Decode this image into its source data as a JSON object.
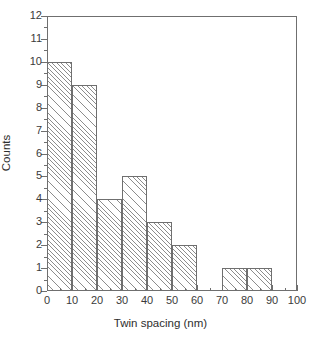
{
  "chart_data": {
    "type": "bar",
    "title": "",
    "subtitle": "",
    "xlabel": "Twin spacing (nm)",
    "ylabel": "Counts",
    "xlim": [
      0,
      100
    ],
    "ylim": [
      0,
      12
    ],
    "grid": false,
    "legend": null,
    "bin_width": 10,
    "bin_edges": [
      0,
      10,
      20,
      30,
      40,
      50,
      60,
      70,
      80,
      90,
      100
    ],
    "categories": [
      "0-10",
      "10-20",
      "20-30",
      "30-40",
      "40-50",
      "50-60",
      "60-70",
      "70-80",
      "80-90",
      "90-100"
    ],
    "values": [
      10,
      9,
      4,
      5,
      3,
      2,
      0,
      1,
      1,
      0
    ],
    "bars": [
      {
        "x0": 0,
        "x1": 10,
        "value": 10
      },
      {
        "x0": 10,
        "x1": 20,
        "value": 9
      },
      {
        "x0": 20,
        "x1": 30,
        "value": 4
      },
      {
        "x0": 30,
        "x1": 40,
        "value": 5
      },
      {
        "x0": 40,
        "x1": 50,
        "value": 3
      },
      {
        "x0": 50,
        "x1": 60,
        "value": 2
      },
      {
        "x0": 60,
        "x1": 70,
        "value": 0
      },
      {
        "x0": 70,
        "x1": 80,
        "value": 1
      },
      {
        "x0": 80,
        "x1": 90,
        "value": 1
      },
      {
        "x0": 90,
        "x1": 100,
        "value": 0
      }
    ],
    "xticks": [
      0,
      10,
      20,
      30,
      40,
      50,
      60,
      70,
      80,
      90,
      100
    ],
    "xtick_labels": [
      "0",
      "10",
      "20",
      "30",
      "40",
      "50",
      "60",
      "70",
      "80",
      "90",
      "100"
    ],
    "xminor_ticks": [
      5,
      15,
      25,
      35,
      45,
      55,
      65,
      75,
      85,
      95
    ],
    "yticks": [
      0,
      1,
      2,
      3,
      4,
      5,
      6,
      7,
      8,
      9,
      10,
      11,
      12
    ],
    "ytick_labels": [
      "0",
      "1",
      "2",
      "3",
      "4",
      "5",
      "6",
      "7",
      "8",
      "9",
      "10",
      "11",
      "12"
    ],
    "yminor_ticks": [
      0.5,
      1.5,
      2.5,
      3.5,
      4.5,
      5.5,
      6.5,
      7.5,
      8.5,
      9.5,
      10.5,
      11.5
    ],
    "total_counts": 35,
    "colors": {
      "axis": "#6f6f6f",
      "bar_edge": "#6f6f6f",
      "bar_hatch": "#8c8c8c",
      "bar_fill": "#ffffff",
      "text": "#2e2e2e",
      "background": "#ffffff"
    },
    "hatch": "forward-diagonal"
  }
}
